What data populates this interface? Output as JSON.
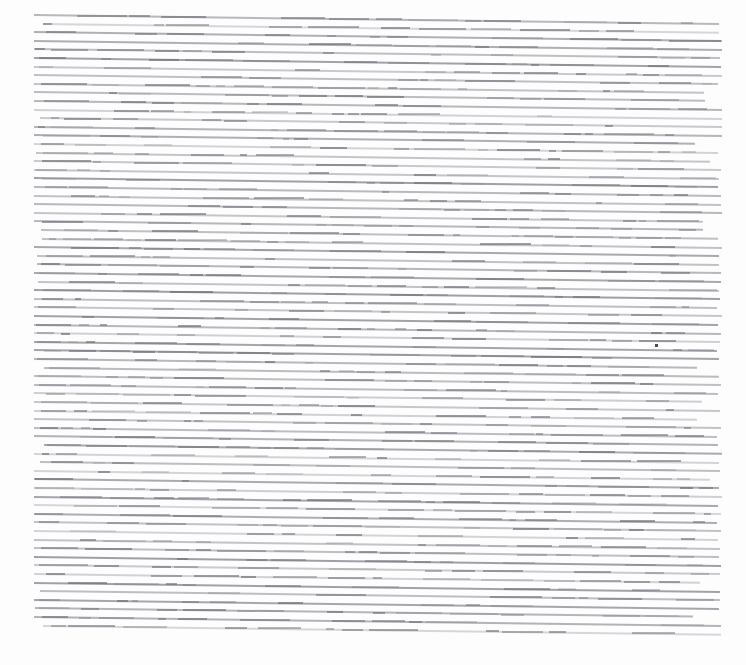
{
  "document": {
    "kind": "scanned-text-page",
    "description": "A photographed or scanned page of dense body text, reproduced at a resolution too low for any individual character to be resolved. Each line of type reads as a single thin grey horizontal streak.",
    "legible_text": "none",
    "headings": "none",
    "paragraph_breaks": "none",
    "columns": 1,
    "page_background_color": "#fdfdfd",
    "canvas": {
      "width": 746,
      "height": 665
    }
  },
  "text_block": {
    "line_count": 72,
    "first_line_y": 14,
    "last_line_y": 634,
    "line_pitch_px": 8.6,
    "left_margin_x": 34,
    "right_margin_x": 722,
    "line_thickness_px": 2,
    "skew_degrees": 0.75,
    "skew_direction": "descending-left-to-right",
    "stroke_color_light": "#b8b8c0",
    "stroke_color_mid": "#9a9aa2",
    "stroke_color_dark": "#6f6f78"
  },
  "margins": {
    "top_px": 14,
    "bottom_px": 31,
    "left_px": 34,
    "right_px": 24
  },
  "artifacts": [
    {
      "name": "ink-speck",
      "x": 655,
      "y": 344,
      "color": "#4a4a52",
      "note": "small isolated dark mark on the page"
    }
  ]
}
